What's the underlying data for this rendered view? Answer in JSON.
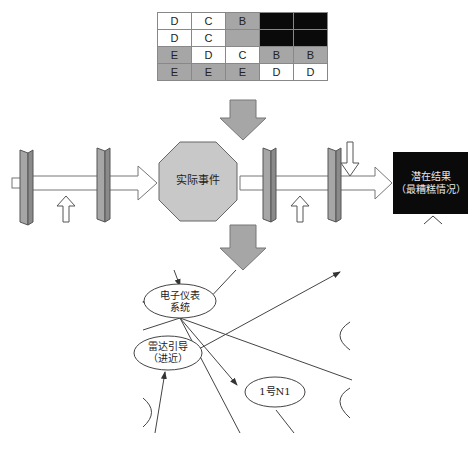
{
  "risk_matrix": {
    "rows": [
      [
        {
          "v": "D",
          "c": "w"
        },
        {
          "v": "C",
          "c": "w"
        },
        {
          "v": "B",
          "c": "g"
        },
        {
          "v": "",
          "c": "k"
        },
        {
          "v": "",
          "c": "k"
        }
      ],
      [
        {
          "v": "D",
          "c": "w"
        },
        {
          "v": "C",
          "c": "w"
        },
        {
          "v": "",
          "c": "g"
        },
        {
          "v": "",
          "c": "k"
        },
        {
          "v": "",
          "c": "k"
        }
      ],
      [
        {
          "v": "E",
          "c": "g"
        },
        {
          "v": "D",
          "c": "w"
        },
        {
          "v": "C",
          "c": "w"
        },
        {
          "v": "B",
          "c": "g"
        },
        {
          "v": "B",
          "c": "g"
        }
      ],
      [
        {
          "v": "E",
          "c": "g"
        },
        {
          "v": "E",
          "c": "g"
        },
        {
          "v": "E",
          "c": "g"
        },
        {
          "v": "D",
          "c": "w"
        },
        {
          "v": "D",
          "c": "w"
        }
      ]
    ]
  },
  "bowtie": {
    "event_label": "实际事件",
    "outcome_label_line1": "潜在结果",
    "outcome_label_line2": "（最糟糕情况）"
  },
  "network": {
    "node1_line1": "电子仪表",
    "node1_line2": "系统",
    "node2_line1": "雷达引导",
    "node2_line2": "（进近）",
    "node3": "1号N1"
  },
  "colors": {
    "gray_fill": "#a6a6a6",
    "octagon_fill": "#c8c8c8",
    "black_fill": "#0a0a0a",
    "line": "#444444"
  }
}
